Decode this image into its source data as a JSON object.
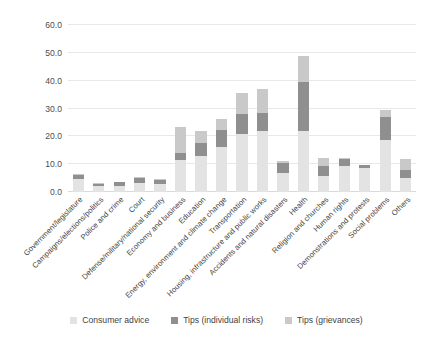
{
  "chart_data": {
    "type": "bar",
    "subtype": "stacked-vertical",
    "title": "",
    "xlabel": "",
    "ylabel": "",
    "ylim": [
      0,
      60
    ],
    "ytick_labels": [
      "0.0",
      "10.0",
      "20.0",
      "30.0",
      "40.0",
      "50.0",
      "60.0"
    ],
    "ytick_values": [
      0,
      10,
      20,
      30,
      40,
      50,
      60
    ],
    "grid": true,
    "legend_position": "bottom",
    "categories": [
      "Government/legislature",
      "Campaigns/elections/politics",
      "Police and crime",
      "Court",
      "Defense/military/national security",
      "Economy and business",
      "Education",
      "Energy, environment and climate change",
      "Transportation",
      "Housing, infrastructure and public works",
      "Accidents and natural disasters",
      "Health",
      "Religion and churches",
      "Human rights",
      "Demonstrations and protests",
      "Social problems",
      "Others"
    ],
    "series": [
      {
        "name": "Consumer advice",
        "color": "#e3e3e3",
        "values": [
          4.8,
          2.0,
          2.3,
          3.3,
          2.9,
          11.6,
          13.0,
          16.3,
          20.8,
          22.0,
          7.0,
          21.8,
          5.8,
          9.3,
          8.6,
          18.7,
          5.0
        ]
      },
      {
        "name": "Tips (individual risks)",
        "color": "#8f8f8f",
        "values": [
          1.2,
          1.0,
          1.2,
          1.7,
          1.4,
          2.3,
          4.6,
          5.9,
          7.4,
          6.3,
          3.4,
          17.8,
          3.4,
          2.5,
          1.2,
          8.3,
          3.0
        ]
      },
      {
        "name": "Tips (grievances)",
        "color": "#c9c9c9",
        "values": [
          0.4,
          0.2,
          0.2,
          0.3,
          0.3,
          9.5,
          4.5,
          4.0,
          7.5,
          8.7,
          0.7,
          9.4,
          2.9,
          0.3,
          0.0,
          2.5,
          3.8
        ]
      }
    ],
    "totals": [
      6.4,
      3.2,
      3.7,
      5.3,
      4.6,
      23.4,
      22.1,
      26.2,
      35.7,
      37.0,
      11.1,
      49.0,
      12.1,
      12.1,
      9.8,
      29.5,
      11.8
    ]
  },
  "legend": {
    "items": [
      {
        "label": "Consumer advice",
        "color": "#e3e3e3"
      },
      {
        "label": "Tips (individual risks)",
        "color": "#8f8f8f"
      },
      {
        "label": "Tips (grievances)",
        "color": "#c9c9c9"
      }
    ]
  }
}
